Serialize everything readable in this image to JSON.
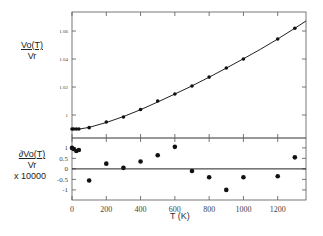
{
  "chart_data": [
    {
      "type": "line",
      "panel": "upper",
      "ylabel": [
        "Vo(T)",
        "Vr"
      ],
      "xlabel": "T (K)",
      "xlim": [
        0,
        1365
      ],
      "ylim": [
        0.9836,
        1.0736
      ],
      "yticks": [
        1,
        1.02,
        1.04,
        1.06
      ],
      "ytick_labels": [
        "1",
        "1.02",
        "1.04",
        "1.06"
      ],
      "xticks": [
        0,
        200,
        400,
        600,
        800,
        1000,
        1200
      ],
      "grid": false,
      "series": [
        {
          "name": "data",
          "style": "markers",
          "x": [
            0,
            10,
            25,
            40,
            100,
            200,
            300,
            400,
            500,
            600,
            700,
            800,
            900,
            1000,
            1200,
            1300
          ],
          "y": [
            0.99,
            0.99,
            0.99,
            0.99,
            0.991,
            0.995,
            0.9986,
            1.004,
            1.01,
            1.015,
            1.0207,
            1.0271,
            1.0336,
            1.04,
            1.0543,
            1.062
          ]
        },
        {
          "name": "fit",
          "style": "line",
          "x": [
            0,
            50,
            100,
            200,
            300,
            400,
            500,
            600,
            700,
            800,
            900,
            1000,
            1100,
            1200,
            1300,
            1365
          ],
          "y": [
            0.99,
            0.9902,
            0.9912,
            0.9947,
            0.9989,
            1.0038,
            1.0093,
            1.015,
            1.0208,
            1.027,
            1.0335,
            1.0402,
            1.047,
            1.0543,
            1.062,
            1.0672
          ]
        }
      ]
    },
    {
      "type": "scatter",
      "panel": "lower",
      "ylabel": [
        "∂Vo(T)",
        "Vr",
        "x 10000"
      ],
      "xlabel": "T (K)",
      "xlim": [
        0,
        1365
      ],
      "ylim": [
        -1.48,
        1.47
      ],
      "yticks": [
        -1,
        -0.5,
        0,
        0.5,
        1
      ],
      "ytick_labels": [
        "-1",
        "-0.5",
        "0",
        "0.5",
        "1"
      ],
      "xticks": [
        0,
        200,
        400,
        600,
        800,
        1000,
        1200
      ],
      "xtick_labels": [
        "0",
        "200",
        "400",
        "600",
        "800",
        "1000",
        "1200"
      ],
      "zero_line": true,
      "grid": false,
      "series": [
        {
          "name": "residuals",
          "x": [
            0,
            10,
            25,
            40,
            100,
            200,
            300,
            400,
            500,
            600,
            700,
            800,
            900,
            1000,
            1200,
            1300
          ],
          "y": [
            1.0,
            0.95,
            0.85,
            0.9,
            -0.55,
            0.25,
            0.05,
            0.35,
            0.65,
            1.05,
            -0.1,
            -0.4,
            -1.0,
            -0.4,
            -0.35,
            0.55
          ]
        }
      ]
    }
  ],
  "labels": {
    "upper_num": "Vo(T)",
    "upper_den": "Vr",
    "lower_num": "∂Vo(T)",
    "lower_den": "Vr",
    "lower_scale": "x 10000",
    "xlabel": "T (K)"
  },
  "colors": {
    "line": "#222222",
    "marker": "#111111",
    "axis": "#555555"
  }
}
